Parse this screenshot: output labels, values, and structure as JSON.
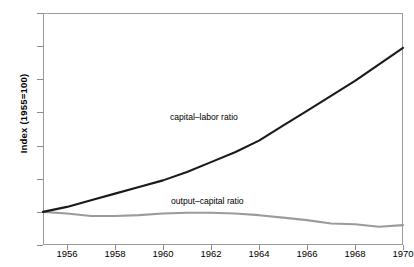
{
  "chart_data": {
    "type": "line",
    "title": "",
    "xlabel": "",
    "ylabel": "Index  (1955=100)",
    "xlim": [
      1955,
      1970
    ],
    "ylim": [
      80,
      220
    ],
    "yticks": [
      80,
      100,
      120,
      140,
      160,
      180,
      200,
      220
    ],
    "xticks": [
      1956,
      1958,
      1960,
      1962,
      1964,
      1966,
      1968,
      1970
    ],
    "grid": false,
    "legend": "inline-annotations",
    "x": [
      1955,
      1956,
      1957,
      1958,
      1959,
      1960,
      1961,
      1962,
      1963,
      1964,
      1965,
      1966,
      1967,
      1968,
      1969,
      1970
    ],
    "series": [
      {
        "name": "capital–labor ratio",
        "color": "#1a1a1a",
        "values": [
          100,
          103,
          107,
          111,
          115,
          119,
          124,
          130,
          136,
          143,
          152,
          161,
          170,
          179,
          189,
          199
        ]
      },
      {
        "name": "output–capital ratio",
        "color": "#9b9b9b",
        "values": [
          100,
          99,
          97.5,
          97.5,
          98,
          99,
          99.5,
          99.5,
          99,
          98,
          96.5,
          95,
          93,
          92.5,
          91,
          92
        ]
      }
    ]
  },
  "axis": {
    "y_title": "Index  (1955=100)",
    "y_tick_labels": [
      "220",
      "200",
      "180",
      "160",
      "140",
      "120",
      "100",
      "80"
    ],
    "x_tick_labels": [
      "1956",
      "1958",
      "1960",
      "1962",
      "1964",
      "1966",
      "1968",
      "1970"
    ]
  },
  "annotations": {
    "capital_labor": "capital–labor ratio",
    "output_capital": "output–capital ratio"
  },
  "colors": {
    "capital_labor_line": "#1a1a1a",
    "output_capital_line": "#9b9b9b",
    "frame": "#9a9a9a",
    "background": "#ffffff"
  }
}
